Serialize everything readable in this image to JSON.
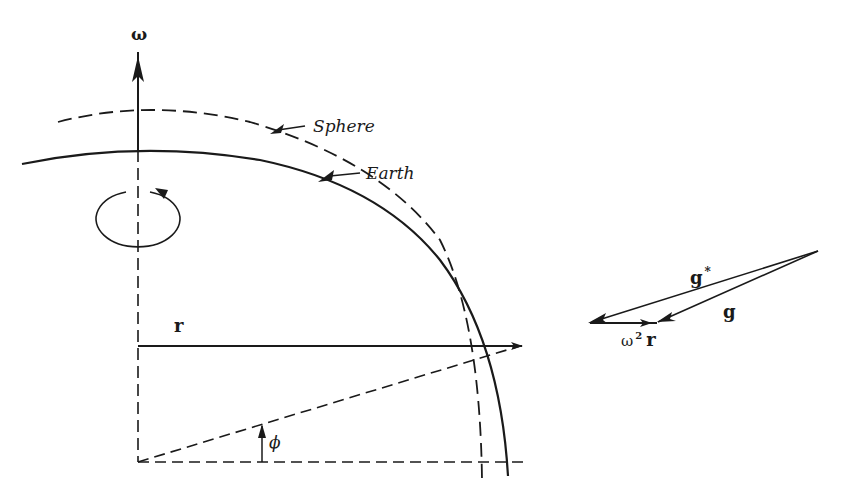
{
  "figure": {
    "labels": {
      "omega": "ω",
      "sphere": "Sphere",
      "earth": "Earth",
      "r": "r",
      "phi": "ϕ",
      "g_star": "g",
      "g_star_sup": "*",
      "g": "g",
      "omega_sq": "ω",
      "omega_sq_sup": "2",
      "omega_sq_r": "r"
    },
    "colors": {
      "ink": "#1a1a1a",
      "background": "#ffffff"
    }
  }
}
